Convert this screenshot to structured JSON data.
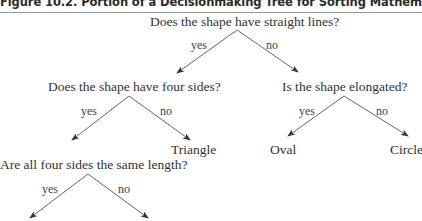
{
  "figure": {
    "title": "Figure 10.2. Portion of a Decisionmaking Tree for Sorting Mathematical Vocabulary"
  },
  "tree": {
    "root": {
      "question": "Does the shape have straight lines?",
      "yes_label": "yes",
      "no_label": "no"
    },
    "four_sides": {
      "question": "Does the shape have four sides?",
      "yes_label": "yes",
      "no_label": "no",
      "no_result": "Triangle"
    },
    "elongated": {
      "question": "Is the shape elongated?",
      "yes_label": "yes",
      "no_label": "no",
      "yes_result": "Oval",
      "no_result": "Circle"
    },
    "same_length": {
      "question": "Are all four sides the same length?",
      "yes_label": "yes",
      "no_label": "no"
    }
  },
  "colors": {
    "line": "#555555",
    "text": "#333333"
  }
}
